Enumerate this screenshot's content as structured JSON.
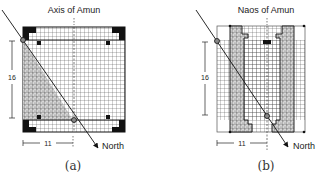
{
  "figure_a": {
    "title": "Axis of Amun",
    "caption": "(a)",
    "vertical_dimension": "16",
    "horizontal_dimension": "11",
    "arrow_label": "North"
  },
  "figure_b": {
    "title": "Naos of Amun",
    "caption": "(b)",
    "vertical_dimension": "16",
    "horizontal_dimension": "11",
    "arrow_label": "North"
  },
  "colors": {
    "line": "#111111",
    "grid": "#333333",
    "hatch": "#bbbbbb",
    "background": "#ffffff"
  }
}
